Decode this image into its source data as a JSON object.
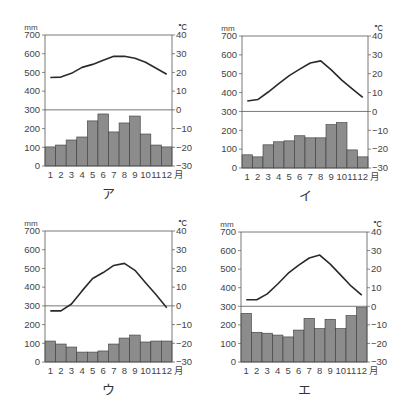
{
  "colors": {
    "bar": "#8c8c8c",
    "bar_stroke": "#3a3a3a",
    "line": "#2a2a2a",
    "axis": "#555555"
  },
  "axis_labels": {
    "left_unit": "mm",
    "right_unit": "℃",
    "month_suffix": "月",
    "left_ticks": [
      "700",
      "600",
      "500",
      "400",
      "300",
      "200",
      "100",
      "0"
    ],
    "right_ticks": [
      "40",
      "30",
      "20",
      "10",
      "0",
      "−10",
      "−20",
      "−30"
    ],
    "months": [
      "1",
      "2",
      "3",
      "4",
      "5",
      "6",
      "7",
      "8",
      "9",
      "10",
      "11",
      "12"
    ]
  },
  "chart_data": [
    {
      "type": "bar+line",
      "title": "ア",
      "xlabel": "月",
      "ylabel_left": "mm",
      "ylabel_right": "℃",
      "categories": [
        "1",
        "2",
        "3",
        "4",
        "5",
        "6",
        "7",
        "8",
        "9",
        "10",
        "11",
        "12"
      ],
      "ylim_left": [
        0,
        700
      ],
      "ylim_right": [
        -30,
        40
      ],
      "series": [
        {
          "name": "precipitation",
          "kind": "bar",
          "unit": "mm",
          "values": [
            102,
            112,
            139,
            155,
            241,
            278,
            182,
            230,
            267,
            171,
            112,
            102
          ]
        },
        {
          "name": "temperature",
          "kind": "line",
          "unit": "℃",
          "values": [
            17.3,
            17.5,
            19.5,
            22.7,
            24.3,
            26.5,
            28.6,
            28.6,
            27.6,
            25.4,
            22.2,
            19.0
          ]
        }
      ]
    },
    {
      "type": "bar+line",
      "title": "イ",
      "xlabel": "月",
      "ylabel_left": "mm",
      "ylabel_right": "℃",
      "categories": [
        "1",
        "2",
        "3",
        "4",
        "5",
        "6",
        "7",
        "8",
        "9",
        "10",
        "11",
        "12"
      ],
      "ylim_left": [
        0,
        700
      ],
      "ylim_right": [
        -30,
        40
      ],
      "series": [
        {
          "name": "precipitation",
          "kind": "bar",
          "unit": "mm",
          "values": [
            70,
            59,
            123,
            139,
            144,
            171,
            160,
            160,
            230,
            241,
            96,
            59
          ]
        },
        {
          "name": "temperature",
          "kind": "line",
          "unit": "℃",
          "values": [
            5.5,
            6.3,
            10.3,
            14.8,
            19.0,
            22.4,
            25.7,
            26.8,
            22.0,
            16.6,
            12.0,
            7.4
          ]
        }
      ]
    },
    {
      "type": "bar+line",
      "title": "ウ",
      "xlabel": "月",
      "ylabel_left": "mm",
      "ylabel_right": "℃",
      "categories": [
        "1",
        "2",
        "3",
        "4",
        "5",
        "6",
        "7",
        "8",
        "9",
        "10",
        "11",
        "12"
      ],
      "ylim_left": [
        0,
        700
      ],
      "ylim_right": [
        -30,
        40
      ],
      "series": [
        {
          "name": "precipitation",
          "kind": "bar",
          "unit": "mm",
          "values": [
            112,
            96,
            80,
            53,
            53,
            59,
            96,
            128,
            144,
            107,
            112,
            112
          ]
        },
        {
          "name": "temperature",
          "kind": "line",
          "unit": "℃",
          "values": [
            -2.7,
            -2.7,
            1.0,
            8.0,
            14.6,
            17.8,
            21.6,
            22.7,
            19.0,
            12.4,
            5.9,
            -1.0
          ]
        }
      ]
    },
    {
      "type": "bar+line",
      "title": "エ",
      "xlabel": "月",
      "ylabel_left": "mm",
      "ylabel_right": "℃",
      "categories": [
        "1",
        "2",
        "3",
        "4",
        "5",
        "6",
        "7",
        "8",
        "9",
        "10",
        "11",
        "12"
      ],
      "ylim_left": [
        0,
        700
      ],
      "ylim_right": [
        -30,
        40
      ],
      "series": [
        {
          "name": "precipitation",
          "kind": "bar",
          "unit": "mm",
          "values": [
            262,
            160,
            155,
            145,
            135,
            172,
            235,
            180,
            230,
            180,
            250,
            293
          ]
        },
        {
          "name": "temperature",
          "kind": "line",
          "unit": "℃",
          "values": [
            3.5,
            3.5,
            6.7,
            12.0,
            17.8,
            22.2,
            26.0,
            27.6,
            22.7,
            16.8,
            10.8,
            6.0
          ]
        }
      ]
    }
  ],
  "layout": {
    "panels": [
      {
        "x0": 45,
        "x1": 172,
        "ytop": 35,
        "ybot": 166
      },
      {
        "x0": 242,
        "x1": 368,
        "ytop": 36,
        "ybot": 168
      },
      {
        "x0": 45,
        "x1": 172,
        "ytop": 231,
        "ybot": 362
      },
      {
        "x0": 241,
        "x1": 367,
        "ytop": 232,
        "ybot": 362
      }
    ]
  }
}
